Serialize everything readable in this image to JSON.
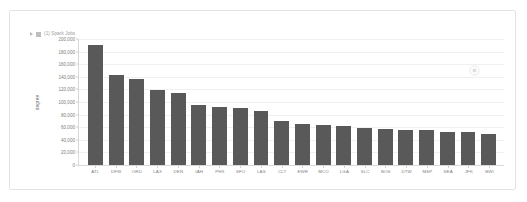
{
  "card": {
    "watermark_icon": "circle-play-icon"
  },
  "legend": {
    "caret_icon": "caret-right-icon",
    "swatch_icon": "legend-swatch-icon",
    "label": "(1) Spark Jobs"
  },
  "chart_data": {
    "type": "bar",
    "title": "",
    "subtitle": "",
    "xlabel": "",
    "ylabel": "degree",
    "ylim": [
      0,
      200000
    ],
    "grid": true,
    "legend_position": "top-left",
    "bar_color": "#595959",
    "categories": [
      "ATL",
      "DFW",
      "ORD",
      "LAX",
      "DEN",
      "IAH",
      "PHX",
      "SFO",
      "LAS",
      "CLT",
      "EWR",
      "MCO",
      "LGA",
      "SLC",
      "BOS",
      "DTW",
      "MSP",
      "SEA",
      "JFK",
      "BWI"
    ],
    "values": [
      190000,
      143000,
      137000,
      119000,
      114000,
      96000,
      92000,
      90000,
      85000,
      70000,
      65000,
      64000,
      62000,
      58000,
      57000,
      56000,
      55000,
      53000,
      52000,
      50000
    ],
    "yticks": [
      {
        "value": 200000,
        "label": "200,000"
      },
      {
        "value": 180000,
        "label": "180,000"
      },
      {
        "value": 160000,
        "label": "160,000"
      },
      {
        "value": 140000,
        "label": "140,000"
      },
      {
        "value": 120000,
        "label": "120,000"
      },
      {
        "value": 100000,
        "label": "100,000"
      },
      {
        "value": 80000,
        "label": "80,000"
      },
      {
        "value": 60000,
        "label": "60,000"
      },
      {
        "value": 40000,
        "label": "40,000"
      },
      {
        "value": 20000,
        "label": "20,000"
      },
      {
        "value": 0,
        "label": "0"
      }
    ]
  }
}
